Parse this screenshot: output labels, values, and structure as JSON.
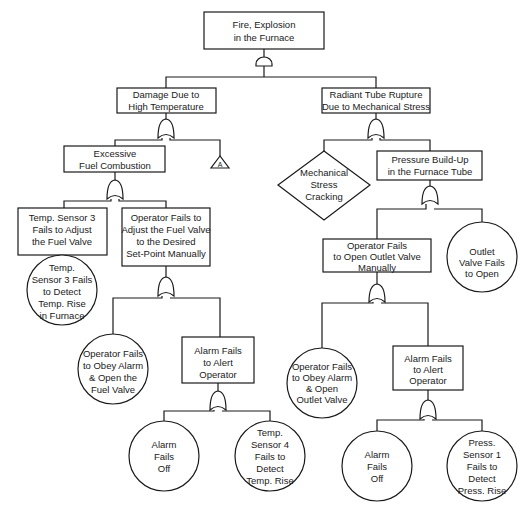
{
  "diagram": {
    "type": "fault-tree",
    "top_event": {
      "id": "top",
      "lines": [
        "Fire, Explosion",
        "in the Furnace"
      ],
      "shape": "rect",
      "gate": "AND"
    },
    "nodes": [
      {
        "id": "top",
        "lines": [
          "Fire, Explosion",
          "in the Furnace"
        ],
        "shape": "rect"
      },
      {
        "id": "damage",
        "lines": [
          "Damage Due to",
          "High Temperature"
        ],
        "shape": "rect"
      },
      {
        "id": "rupture",
        "lines": [
          "Radiant Tube Rupture",
          "Due to Mechanical Stress"
        ],
        "shape": "rect"
      },
      {
        "id": "fuel",
        "lines": [
          "Excessive",
          "Fuel Combustion"
        ],
        "shape": "rect"
      },
      {
        "id": "transfer_a",
        "lines": [
          "A"
        ],
        "shape": "triangle"
      },
      {
        "id": "cracking",
        "lines": [
          "Mechanical",
          "Stress",
          "Cracking"
        ],
        "shape": "diamond"
      },
      {
        "id": "pressure",
        "lines": [
          "Pressure Build-Up",
          "in the Furnace Tube"
        ],
        "shape": "rect"
      },
      {
        "id": "ts3_adjust",
        "lines": [
          "Temp. Sensor 3",
          "Fails to Adjust",
          "the Fuel Valve"
        ],
        "shape": "rect"
      },
      {
        "id": "op_adjust",
        "lines": [
          "Operator Fails to",
          "Adjust the Fuel Valve",
          "to the Desired",
          "Set-Point Manually"
        ],
        "shape": "rect"
      },
      {
        "id": "ts3_detect",
        "lines": [
          "Temp.",
          "Sensor 3 Fails",
          "to Detect",
          "Temp. Rise",
          "in Furnace"
        ],
        "shape": "circle"
      },
      {
        "id": "op_obey_fuel",
        "lines": [
          "Operator Fails",
          "to Obey Alarm",
          "& Open the",
          "Fuel Valve"
        ],
        "shape": "circle"
      },
      {
        "id": "alarm_alert_1",
        "lines": [
          "Alarm Fails",
          "to Alert",
          "Operator"
        ],
        "shape": "rect"
      },
      {
        "id": "alarm_off_1",
        "lines": [
          "Alarm",
          "Fails",
          "Off"
        ],
        "shape": "circle"
      },
      {
        "id": "ts4_detect",
        "lines": [
          "Temp.",
          "Sensor 4",
          "Fails to",
          "Detect",
          "Temp. Rise"
        ],
        "shape": "circle"
      },
      {
        "id": "op_open_outlet",
        "lines": [
          "Operator Fails",
          "to Open Outlet Valve",
          "Manually"
        ],
        "shape": "rect"
      },
      {
        "id": "outlet_fail",
        "lines": [
          "Outlet",
          "Valve Fails",
          "to Open"
        ],
        "shape": "circle"
      },
      {
        "id": "op_obey_outlet",
        "lines": [
          "Operator Fails",
          "to Obey Alarm",
          "& Open",
          "Outlet Valve"
        ],
        "shape": "circle"
      },
      {
        "id": "alarm_alert_2",
        "lines": [
          "Alarm Fails",
          "to Alert",
          "Operator"
        ],
        "shape": "rect"
      },
      {
        "id": "alarm_off_2",
        "lines": [
          "Alarm",
          "Fails",
          "Off"
        ],
        "shape": "circle"
      },
      {
        "id": "ps1_detect",
        "lines": [
          "Press.",
          "Sensor 1",
          "Fails to",
          "Detect",
          "Press. Rise"
        ],
        "shape": "circle"
      }
    ],
    "gates": [
      {
        "parent": "top",
        "type": "AND",
        "children": [
          "damage",
          "rupture"
        ]
      },
      {
        "parent": "damage",
        "type": "OR",
        "children": [
          "fuel",
          "transfer_a"
        ]
      },
      {
        "parent": "rupture",
        "type": "OR",
        "children": [
          "cracking",
          "pressure"
        ]
      },
      {
        "parent": "fuel",
        "type": "OR",
        "children": [
          "ts3_adjust",
          "op_adjust"
        ]
      },
      {
        "parent": "ts3_adjust",
        "type": "direct",
        "children": [
          "ts3_detect"
        ]
      },
      {
        "parent": "op_adjust",
        "type": "OR",
        "children": [
          "op_obey_fuel",
          "alarm_alert_1"
        ]
      },
      {
        "parent": "alarm_alert_1",
        "type": "OR",
        "children": [
          "alarm_off_1",
          "ts4_detect"
        ]
      },
      {
        "parent": "pressure",
        "type": "OR",
        "children": [
          "op_open_outlet",
          "outlet_fail"
        ]
      },
      {
        "parent": "op_open_outlet",
        "type": "OR",
        "children": [
          "op_obey_outlet",
          "alarm_alert_2"
        ]
      },
      {
        "parent": "alarm_alert_2",
        "type": "OR",
        "children": [
          "alarm_off_2",
          "ps1_detect"
        ]
      }
    ]
  },
  "labels": {
    "top": [
      "Fire, Explosion",
      "in the Furnace"
    ],
    "damage": [
      "Damage Due to",
      "High Temperature"
    ],
    "rupture": [
      "Radiant Tube Rupture",
      "Due to Mechanical Stress"
    ],
    "fuel": [
      "Excessive",
      "Fuel Combustion"
    ],
    "transfer_a": "A",
    "cracking": [
      "Mechanical",
      "Stress",
      "Cracking"
    ],
    "pressure": [
      "Pressure Build-Up",
      "in the Furnace Tube"
    ],
    "ts3_adjust": [
      "Temp. Sensor 3",
      "Fails to Adjust",
      "the Fuel Valve"
    ],
    "op_adjust": [
      "Operator Fails to",
      "Adjust the Fuel Valve",
      "to the Desired",
      "Set-Point Manually"
    ],
    "ts3_detect": [
      "Temp.",
      "Sensor 3 Fails",
      "to Detect",
      "Temp. Rise",
      "in Furnace"
    ],
    "op_obey_fuel": [
      "Operator Fails",
      "to Obey Alarm",
      "& Open the",
      "Fuel Valve"
    ],
    "alarm_alert_1": [
      "Alarm Fails",
      "to Alert",
      "Operator"
    ],
    "alarm_off_1": [
      "Alarm",
      "Fails",
      "Off"
    ],
    "ts4_detect": [
      "Temp.",
      "Sensor 4",
      "Fails to",
      "Detect",
      "Temp. Rise"
    ],
    "op_open_outlet": [
      "Operator Fails",
      "to Open Outlet Valve",
      "Manually"
    ],
    "outlet_fail": [
      "Outlet",
      "Valve Fails",
      "to Open"
    ],
    "op_obey_outlet": [
      "Operator Fails",
      "to Obey Alarm",
      "& Open",
      "Outlet Valve"
    ],
    "alarm_alert_2": [
      "Alarm Fails",
      "to Alert",
      "Operator"
    ],
    "alarm_off_2": [
      "Alarm",
      "Fails",
      "Off"
    ],
    "ps1_detect": [
      "Press.",
      "Sensor 1",
      "Fails to",
      "Detect",
      "Press. Rise"
    ]
  }
}
